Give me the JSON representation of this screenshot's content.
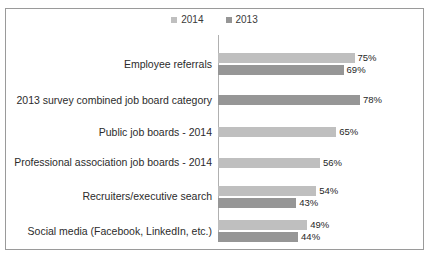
{
  "chart_data": {
    "type": "bar",
    "orientation": "horizontal",
    "title": "",
    "subtitle": "",
    "xlabel": "",
    "ylabel": "",
    "xlim": [
      0,
      100
    ],
    "grid": false,
    "legend_position": "top-center",
    "value_suffix": "%",
    "categories": [
      "Employee referrals",
      "2013 survey combined job board category",
      "Public job boards - 2014",
      "Professional association job boards - 2014",
      "Recruiters/executive search",
      "Social media (Facebook, LinkedIn, etc.)"
    ],
    "series": [
      {
        "name": "2014",
        "color": "#bfbfbf",
        "values": [
          75,
          null,
          65,
          56,
          54,
          49
        ]
      },
      {
        "name": "2013",
        "color": "#969696",
        "values": [
          69,
          78,
          null,
          null,
          43,
          44
        ]
      }
    ],
    "data_labels": {
      "2014": [
        "75%",
        "",
        "65%",
        "56%",
        "54%",
        "49%"
      ],
      "2013": [
        "69%",
        "78%",
        "",
        "",
        "43%",
        "44%"
      ]
    }
  },
  "legend": {
    "items": [
      {
        "label": "2014",
        "color": "#bfbfbf"
      },
      {
        "label": "2013",
        "color": "#969696"
      }
    ]
  },
  "frame": {
    "border_color": "#9a9a9a",
    "background": "#ffffff"
  }
}
